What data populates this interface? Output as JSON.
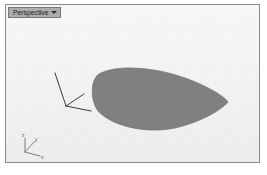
{
  "window": {
    "background_color": "#ffffff"
  },
  "viewport": {
    "name": "perspective-viewport",
    "title": "Perspective",
    "title_caret_icon": "chevron-down-icon",
    "background_color": "#f2f2f2",
    "border_color": "#8b8b8b",
    "tab_background_color": "#adadad",
    "tab_text_color": "#1c1c1c"
  },
  "scene": {
    "solid": {
      "name": "lens-surface",
      "fill_color": "#808080",
      "stroke_color": "#6f6f6f",
      "description": "shaded elliptical lens surface"
    },
    "construction_plane_axes": {
      "name": "cplane-axis-triad",
      "color": "#3a3a3a",
      "axes": [
        "z",
        "y",
        "x"
      ]
    },
    "world_axis_gizmo": {
      "name": "world-axis-gizmo",
      "color": "#5a5a5a",
      "labels": {
        "z": "z",
        "y": "y",
        "x": "x"
      }
    }
  }
}
